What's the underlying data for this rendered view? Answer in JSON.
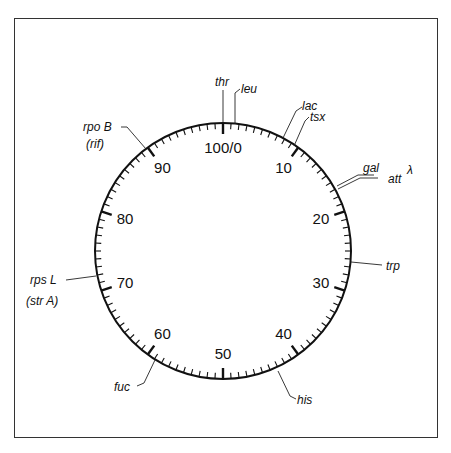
{
  "diagram": {
    "scale": {
      "min": 0,
      "max": 100,
      "major_step": 10,
      "minor_step": 1
    },
    "major_labels": [
      {
        "value": 0,
        "label": "100/0"
      },
      {
        "value": 10,
        "label": "10"
      },
      {
        "value": 20,
        "label": "20"
      },
      {
        "value": 30,
        "label": "30"
      },
      {
        "value": 40,
        "label": "40"
      },
      {
        "value": 50,
        "label": "50"
      },
      {
        "value": 60,
        "label": "60"
      },
      {
        "value": 70,
        "label": "70"
      },
      {
        "value": 80,
        "label": "80"
      },
      {
        "value": 90,
        "label": "90"
      }
    ],
    "genes": [
      {
        "name": "thr",
        "position": 0
      },
      {
        "name": "leu",
        "position": 2
      },
      {
        "name": "lac",
        "position": 8
      },
      {
        "name": "tsx",
        "position": 9.5
      },
      {
        "name": "gal",
        "position": 17
      },
      {
        "name": "attλ",
        "position": 17.3
      },
      {
        "name": "trp",
        "position": 27
      },
      {
        "name": "his",
        "position": 44
      },
      {
        "name": "fuc",
        "position": 60.5
      },
      {
        "name": "rps L",
        "subtitle": "(str A)",
        "position": 73
      },
      {
        "name": "rpo B",
        "subtitle": "(rif)",
        "position": 90
      }
    ]
  },
  "labels": {
    "thr": "thr",
    "leu": "leu",
    "lac": "lac",
    "tsx": "tsx",
    "gal": "gal",
    "att": "att",
    "lambda": "λ",
    "trp": "trp",
    "his": "his",
    "fuc": "fuc",
    "rpsL": "rps L",
    "strA": "(str A)",
    "rpoB": "rpo B",
    "rif": "(rif)"
  }
}
